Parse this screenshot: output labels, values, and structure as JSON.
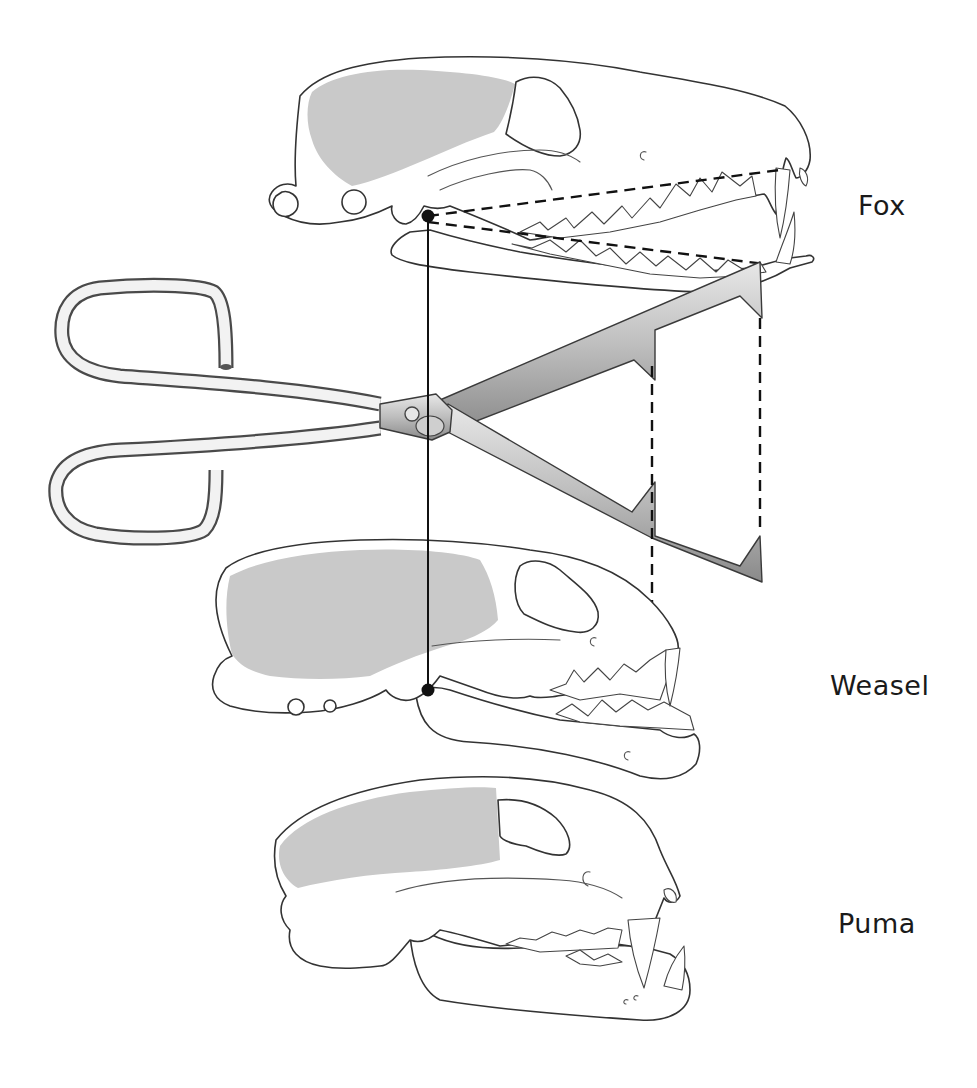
{
  "figure": {
    "labels": {
      "fox": "Fox",
      "weasel": "Weasel",
      "puma": "Puma"
    },
    "colors": {
      "braincase_fill": "#c9c9c9",
      "line": "#111111",
      "outline": "#333333",
      "background": "#ffffff"
    },
    "elements": {
      "skulls": [
        "fox",
        "weasel",
        "puma"
      ],
      "tool": "tongs",
      "markers": [
        "jaw-pivot-fox",
        "jaw-pivot-weasel"
      ],
      "guide_lines": [
        "solid-pivot-line",
        "dashed-tooth-line-upper",
        "dashed-tooth-line-lower",
        "dashed-vertical-carnassial",
        "dashed-vertical-canine"
      ]
    }
  }
}
